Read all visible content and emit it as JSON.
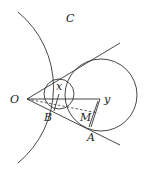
{
  "diagram": {
    "labels": {
      "O": "O",
      "C": "C",
      "x": "x",
      "y": "y",
      "B": "B",
      "M": "M",
      "A": "A"
    },
    "colors": {
      "stroke": "#333333",
      "text": "#222222",
      "background": "#ffffff"
    }
  }
}
